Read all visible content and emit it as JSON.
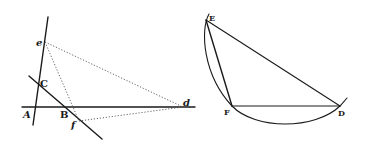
{
  "figure_left": {
    "labels": {
      "e": "e",
      "C": "C",
      "A": "A",
      "B": "B",
      "f": "f",
      "d": "d"
    },
    "points": {
      "e": [
        45,
        42
      ],
      "C": [
        39,
        84
      ],
      "A": [
        36,
        107
      ],
      "B": [
        66,
        107
      ],
      "f": [
        79,
        121
      ],
      "d": [
        183,
        107
      ]
    },
    "solid_lines": [
      {
        "name": "line-through-e-C-A",
        "from": [
          48,
          17
        ],
        "to": [
          33,
          125
        ]
      },
      {
        "name": "line-through-C-B-f",
        "from": [
          29,
          76
        ],
        "to": [
          102,
          139
        ]
      },
      {
        "name": "horizontal-line-A-B-d",
        "from": [
          22,
          107
        ],
        "to": [
          195,
          107
        ]
      }
    ],
    "dotted_lines": [
      {
        "name": "e-to-d",
        "from": [
          45,
          42
        ],
        "to": [
          183,
          107
        ]
      },
      {
        "name": "e-to-f",
        "from": [
          45,
          42
        ],
        "to": [
          79,
          121
        ]
      },
      {
        "name": "f-to-d",
        "from": [
          79,
          121
        ],
        "to": [
          183,
          107
        ]
      }
    ]
  },
  "figure_right": {
    "labels": {
      "E": "E",
      "F": "F",
      "D": "D"
    },
    "points": {
      "E": [
        206,
        20
      ],
      "F": [
        232,
        106
      ],
      "D": [
        340,
        106
      ]
    },
    "solid_lines": [
      {
        "name": "E-to-D",
        "from": [
          206,
          20
        ],
        "to": [
          340,
          106
        ]
      },
      {
        "name": "E-to-F",
        "from": [
          206,
          20
        ],
        "to": [
          232,
          106
        ]
      },
      {
        "name": "F-to-D",
        "from": [
          232,
          106
        ],
        "to": [
          340,
          106
        ]
      }
    ],
    "arc": {
      "name": "circle-arc-E-F-D"
    }
  }
}
